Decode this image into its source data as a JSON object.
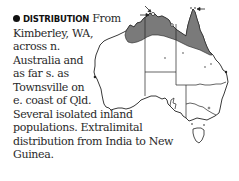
{
  "entry": {
    "heading": "DISTRIBUTION",
    "lines": [
      " From",
      "Kimberley, WA,",
      "across n.",
      "Australia and",
      "as far s. as",
      "Townsville on",
      "e. coast of Qld.",
      "Several isolated inland",
      "populations. Extralimital",
      "distribution from India to New",
      "Guinea."
    ],
    "full_text": "DISTRIBUTION From Kimberley, WA, across n. Australia and as far s. as Townsville on e. coast of Qld. Several isolated inland populations. Extralimital distribution from India to New Guinea."
  },
  "map": {
    "subject": "Australia distribution map",
    "range_fill_color": "#7a7a7a",
    "outline_color": "#222222",
    "markers": [
      "arrow pointing to island (NT north coast)",
      "arrow pointing to island (Cape York)",
      "isolated inland population dots"
    ]
  }
}
